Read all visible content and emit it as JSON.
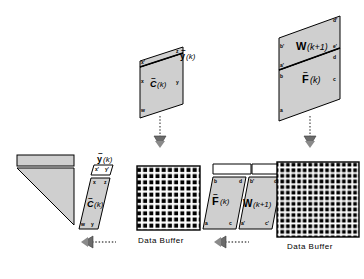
{
  "figure": {
    "background_color": "#ffffff",
    "fill_gray": "#cfcfcf",
    "fill_white": "#ffffff",
    "stroke_color": "#000000"
  },
  "top_left_block": {
    "name": "C-tilde-k-panel",
    "matrix_label": "C",
    "matrix_tilde": "~",
    "matrix_arg": "(k)",
    "vector_label": "y",
    "vector_tilde": "~",
    "vector_arg": "(k)",
    "corners": {
      "strip_left": "x'",
      "strip_right": "z",
      "body_left": "x",
      "body_right": "y",
      "body_bottom_left": "w"
    }
  },
  "top_right_block": {
    "name": "W-F-panel",
    "upper_matrix_label": "W",
    "upper_matrix_arg": "(k+1)",
    "lower_matrix_label": "F",
    "lower_matrix_tilde": "~",
    "lower_matrix_arg": "(k)",
    "corners": {
      "upper_top_right": "d'",
      "upper_left": "b'",
      "upper_right": "e'",
      "divider_right": "d",
      "lower_upper_left": "a'",
      "lower_left": "b",
      "lower_right": "c",
      "lower_bottom_left": "a"
    }
  },
  "bottom_left_triangle": {
    "name": "triangular-array",
    "bar_fill": "#cfcfcf",
    "body_fill": "#cfcfcf"
  },
  "bottom_c_block": {
    "name": "C-tilde-k-slanted",
    "matrix_label": "C",
    "matrix_tilde": "~",
    "matrix_arg": "(k)",
    "vector_label": "y",
    "vector_tilde": "~",
    "vector_arg": "(k)",
    "corners": {
      "strip_left": "x'",
      "strip_right": "y'",
      "body_top_left": "x",
      "body_top_right": "z",
      "body_bottom_left": "w",
      "body_bottom_right": "y"
    }
  },
  "bottom_fw_block": {
    "name": "F-W-slanted-pair",
    "left_matrix_label": "F",
    "left_matrix_tilde": "~",
    "left_matrix_arg": "(k)",
    "right_matrix_label": "W",
    "right_matrix_arg": "(k+1)",
    "left_corners": {
      "top_left": "b",
      "top_right": "d",
      "bottom_left": "a",
      "bottom_right": "c"
    },
    "right_corners": {
      "top_left": "b'",
      "top_right": "d'",
      "bottom_left": "a'",
      "bottom_right": "c'"
    }
  },
  "buffers": [
    {
      "name": "data-buffer-left",
      "label": "Data  Buffer",
      "cols": 11,
      "rows": 13
    },
    {
      "name": "data-buffer-right",
      "label": "Data  Buffer",
      "cols": 15,
      "rows": 15
    }
  ],
  "arrows": {
    "down_left": {
      "name": "arrow-down-left",
      "direction": "down",
      "style": "dotted"
    },
    "down_right": {
      "name": "arrow-down-right",
      "direction": "down",
      "style": "dotted"
    },
    "left_one": {
      "name": "arrow-left-one",
      "direction": "left",
      "style": "dotted"
    },
    "left_two": {
      "name": "arrow-left-two",
      "direction": "left",
      "style": "dotted"
    }
  }
}
